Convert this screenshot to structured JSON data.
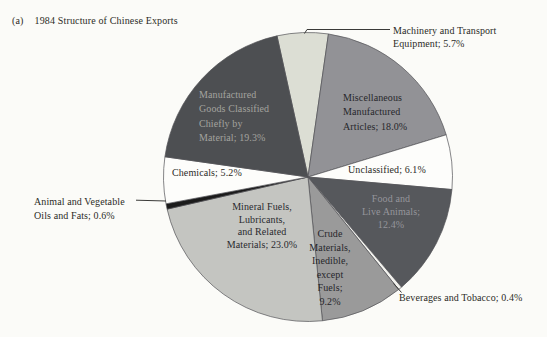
{
  "title": {
    "prefix": "(a)",
    "text": "1984 Structure of Chinese Exports"
  },
  "chart_data": {
    "type": "pie",
    "title": "1984 Structure of Chinese Exports",
    "units": "percent",
    "start_angle_deg": -12.4,
    "direction": "clockwise",
    "slices": [
      {
        "id": "machinery",
        "name": "Machinery and Transport Equipment",
        "value": 5.7,
        "fill": "#dcded4",
        "label_lines": [
          "Machinery and Transport",
          "Equipment; 5.7%"
        ]
      },
      {
        "id": "misc",
        "name": "Miscellaneous Manufactured Articles",
        "value": 18.0,
        "fill": "#929296",
        "label_lines": [
          "Miscellaneous",
          "Manufactured",
          "Articles; 18.0%"
        ]
      },
      {
        "id": "unclassified",
        "name": "Unclassified",
        "value": 6.1,
        "fill": "#fdfdfb",
        "label_lines": [
          "Unclassified; 6.1%"
        ]
      },
      {
        "id": "food",
        "name": "Food and Live Animals",
        "value": 12.4,
        "fill": "#56585c",
        "label_lines": [
          "Food and",
          "Live Animals;",
          "12.4%"
        ]
      },
      {
        "id": "beverages",
        "name": "Beverages and Tobacco",
        "value": 0.4,
        "fill": "#f2f2ee",
        "label_lines": [
          "Beverages and Tobacco; 0.4%"
        ]
      },
      {
        "id": "crude",
        "name": "Crude Materials, Inedible, except Fuels",
        "value": 9.2,
        "fill": "#9a9a9a",
        "label_lines": [
          "Crude",
          "Materials,",
          "Inedible,",
          "except",
          "Fuels;",
          "9.2%"
        ]
      },
      {
        "id": "mineral",
        "name": "Mineral Fuels, Lubricants, and Related Materials",
        "value": 23.0,
        "fill": "#c4c5c1",
        "label_lines": [
          "Mineral Fuels,",
          "Lubricants,",
          "and Related",
          "Materials; 23.0%"
        ]
      },
      {
        "id": "animal",
        "name": "Animal and Vegetable Oils and Fats",
        "value": 0.6,
        "fill": "#1b1b1b",
        "label_lines": [
          "Animal and Vegetable",
          "Oils and Fats; 0.6%"
        ]
      },
      {
        "id": "chemicals",
        "name": "Chemicals",
        "value": 5.2,
        "fill": "#fdfdfb",
        "label_lines": [
          "Chemicals; 5.2%"
        ]
      },
      {
        "id": "manufactured",
        "name": "Manufactured Goods Classified Chiefly by Material",
        "value": 19.3,
        "fill": "#4d4f52",
        "label_lines": [
          "Manufactured",
          "Goods Classified",
          "Chiefly by",
          "Material; 19.3%"
        ]
      }
    ]
  }
}
